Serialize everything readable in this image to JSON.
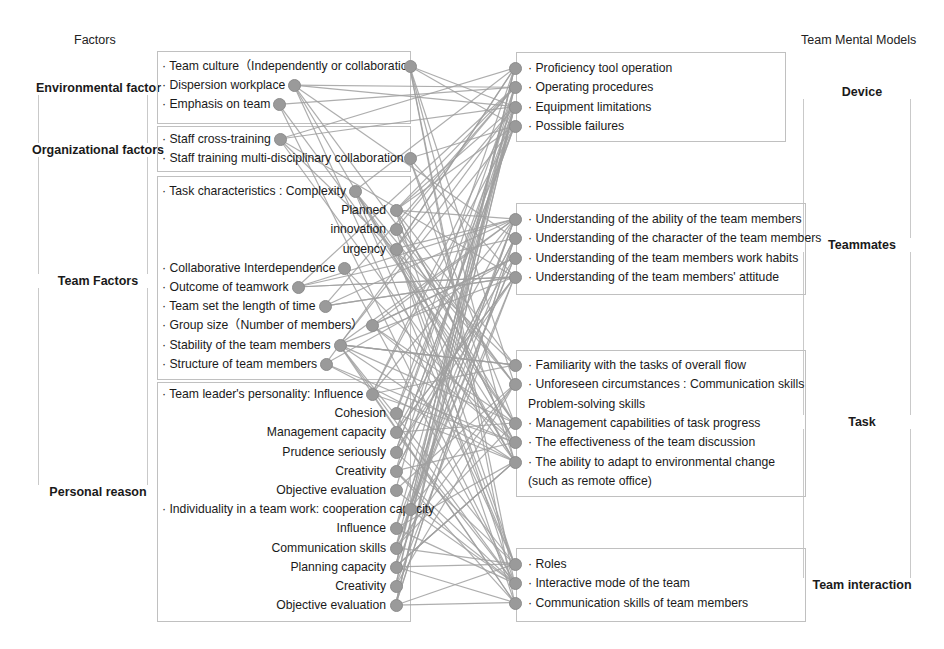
{
  "headers": {
    "left": "Factors",
    "right": "Team Mental Models"
  },
  "left_groups": [
    {
      "id": "environmental",
      "label": "Environmental factor"
    },
    {
      "id": "organizational",
      "label": "Organizational factors"
    },
    {
      "id": "team",
      "label": "Team Factors"
    },
    {
      "id": "personal",
      "label": "Personal reason"
    }
  ],
  "right_groups": [
    {
      "id": "device",
      "label": "Device"
    },
    {
      "id": "teammates",
      "label": "Teammates"
    },
    {
      "id": "task",
      "label": "Task"
    },
    {
      "id": "interaction",
      "label": "Team interaction"
    }
  ],
  "left_panels": [
    {
      "id": "panel-environmental",
      "items": [
        {
          "text": "· Team culture（Independently or collaboration",
          "align": "l"
        },
        {
          "text": "· Dispersion workplace",
          "align": "l"
        },
        {
          "text": "· Emphasis on team",
          "align": "l"
        }
      ]
    },
    {
      "id": "panel-organizational",
      "items": [
        {
          "text": "· Staff cross-training",
          "align": "l"
        },
        {
          "text": "· Staff training multi-disciplinary collaboration",
          "align": "l"
        }
      ]
    },
    {
      "id": "panel-team",
      "items": [
        {
          "text": "· Task characteristics : Complexity",
          "align": "l"
        },
        {
          "text": "Planned",
          "align": "r"
        },
        {
          "text": "innovation",
          "align": "r"
        },
        {
          "text": "urgency",
          "align": "r"
        },
        {
          "text": "· Collaborative Interdependence",
          "align": "l"
        },
        {
          "text": "· Outcome of teamwork",
          "align": "l"
        },
        {
          "text": "· Team set the length of time",
          "align": "l"
        },
        {
          "text": "· Group size（Number of members）",
          "align": "l"
        },
        {
          "text": "· Stability of the team members",
          "align": "l"
        },
        {
          "text": "· Structure of team members",
          "align": "l"
        }
      ]
    },
    {
      "id": "panel-personal",
      "items": [
        {
          "text": "· Team leader's personality: Influence",
          "align": "l"
        },
        {
          "text": "Cohesion",
          "align": "r"
        },
        {
          "text": "Management capacity",
          "align": "r"
        },
        {
          "text": "Prudence seriously",
          "align": "r"
        },
        {
          "text": "Creativity",
          "align": "r"
        },
        {
          "text": "Objective evaluation",
          "align": "r"
        },
        {
          "text": "· Individuality in a team work: cooperation capacity",
          "align": "l"
        },
        {
          "text": "Influence",
          "align": "r"
        },
        {
          "text": "Communication skills",
          "align": "r"
        },
        {
          "text": "Planning capacity",
          "align": "r"
        },
        {
          "text": "Creativity",
          "align": "r"
        },
        {
          "text": "Objective evaluation",
          "align": "r"
        }
      ]
    }
  ],
  "right_panels": [
    {
      "id": "panel-device",
      "items": [
        {
          "text": "· Proficiency tool operation"
        },
        {
          "text": "· Operating procedures"
        },
        {
          "text": "· Equipment limitations"
        },
        {
          "text": "· Possible failures"
        }
      ]
    },
    {
      "id": "panel-teammates",
      "items": [
        {
          "text": "· Understanding of the ability of the team members"
        },
        {
          "text": "· Understanding of the character of the team members"
        },
        {
          "text": "· Understanding of the team members work habits"
        },
        {
          "text": "· Understanding of the team members' attitude"
        }
      ]
    },
    {
      "id": "panel-task",
      "items": [
        {
          "text": "· Familiarity with the tasks of overall flow"
        },
        {
          "text": "· Unforeseen circumstances : Communication skills"
        },
        {
          "text": "Problem-solving skills"
        },
        {
          "text": "· Management capabilities of task progress"
        },
        {
          "text": "· The effectiveness of the team discussion"
        },
        {
          "text": "· The ability to adapt to environmental change"
        },
        {
          "text": "(such as remote office)"
        }
      ]
    },
    {
      "id": "panel-interaction",
      "items": [
        {
          "text": "· Roles"
        },
        {
          "text": "· Interactive mode of the team"
        },
        {
          "text": "· Communication skills of team members"
        }
      ]
    }
  ],
  "colors": {
    "node": "#9a9a9a",
    "link": "#a0a0a0",
    "panel_border": "#c0c0c0",
    "bracket_border": "#c9c9c9",
    "text": "#1a1a1a"
  },
  "geometry": {
    "left_nodes_y": [
      68,
      87,
      106,
      140,
      158,
      191,
      212,
      232,
      252,
      268,
      286,
      305,
      323,
      342,
      360,
      394,
      414,
      435,
      455,
      473,
      492,
      511,
      530,
      549,
      568,
      586,
      605
    ],
    "right_nodes_y": [
      69,
      88,
      107,
      126,
      219,
      238,
      259,
      279,
      365,
      385,
      404,
      423,
      442,
      461,
      481,
      562,
      581,
      601
    ]
  }
}
